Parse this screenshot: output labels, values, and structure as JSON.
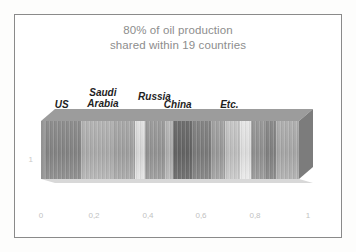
{
  "chart_data": {
    "type": "bar",
    "orientation": "horizontal",
    "stacked": true,
    "style": "3d-grayscale-stacked-bar",
    "title": "80% of oil production shared within 19 countries",
    "title_lines": [
      "80% of oil production",
      "shared within 19 countries"
    ],
    "xlabel": "",
    "ylabel": "",
    "xlim": [
      0,
      1
    ],
    "ylim": [
      0,
      1
    ],
    "grid": false,
    "legend": false,
    "x_tick_labels": [
      "0",
      "0,2",
      "0,4",
      "0,6",
      "0,8",
      "1"
    ],
    "x_tick_values": [
      0,
      0.2,
      0.4,
      0.6,
      0.8,
      1
    ],
    "y_tick_labels": [
      "1"
    ],
    "y_tick_values": [
      1
    ],
    "categories": [
      "US",
      "Saudi Arabia",
      "Russia",
      "China",
      "Etc."
    ],
    "annotations": [
      {
        "text": "US",
        "x": 0.08
      },
      {
        "text": "Saudi\nArabia",
        "x": 0.24
      },
      {
        "text": "Russia",
        "x": 0.44
      },
      {
        "text": "China",
        "x": 0.53
      },
      {
        "text": "Etc.",
        "x": 0.73
      }
    ],
    "segments": [
      {
        "label": "US",
        "value": 0.155,
        "color": "#8e8e8e"
      },
      {
        "label": "Saudi Arabia",
        "value": 0.125,
        "color": "#b4b4b4"
      },
      {
        "label": "Russia",
        "value": 0.085,
        "color": "#a9a9a9"
      },
      {
        "label": "China",
        "value": 0.04,
        "color": "#e0e0e0"
      },
      {
        "label": "Etc. 5",
        "value": 0.075,
        "color": "#9d9d9d"
      },
      {
        "label": "Etc. 6",
        "value": 0.03,
        "color": "#b8b8b8"
      },
      {
        "label": "Etc. 7",
        "value": 0.075,
        "color": "#6f6f6f"
      },
      {
        "label": "Etc. 8",
        "value": 0.075,
        "color": "#858585"
      },
      {
        "label": "Etc. 9",
        "value": 0.055,
        "color": "#a3a3a3"
      },
      {
        "label": "Etc. 10",
        "value": 0.055,
        "color": "#c7c7c7"
      },
      {
        "label": "Etc. 11",
        "value": 0.045,
        "color": "#e6e6e6"
      },
      {
        "label": "Etc. 12",
        "value": 0.055,
        "color": "#9a9a9a"
      },
      {
        "label": "Etc. 13",
        "value": 0.04,
        "color": "#8b8b8b"
      },
      {
        "label": "Etc. 14",
        "value": 0.09,
        "color": "#b0b0b0"
      }
    ],
    "colors": {
      "title_text": "#8d8d8d",
      "label_text": "#1e1e1e",
      "tick_text": "#c2c2c2",
      "frame_border": "#8a8a8a",
      "bar_top_face": "#9c9c9c",
      "bar_right_face": "#7c7c7c",
      "background": "#ffffff"
    }
  },
  "axes": {
    "x_ticks": [
      {
        "label": "0",
        "left": 26
      },
      {
        "label": "0,2",
        "left": 79
      },
      {
        "label": "0,4",
        "left": 133
      },
      {
        "label": "0,6",
        "left": 186
      },
      {
        "label": "0,8",
        "left": 240
      },
      {
        "label": "1",
        "left": 293
      }
    ],
    "y_tick": "1"
  }
}
